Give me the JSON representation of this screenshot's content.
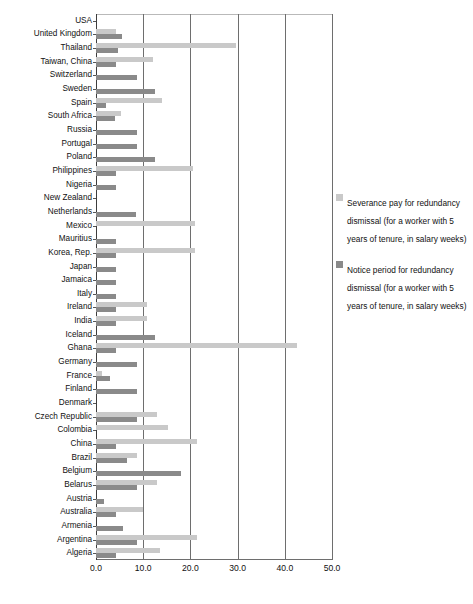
{
  "chart_data": {
    "type": "bar",
    "orientation": "horizontal",
    "title": "",
    "xlabel": "",
    "ylabel": "",
    "xlim": [
      0,
      50
    ],
    "xticks": [
      "0.0",
      "10.0",
      "20.0",
      "30.0",
      "40.0",
      "50.0"
    ],
    "grid": true,
    "legend_position": "right",
    "colors": {
      "severance": "#c9c9c9",
      "notice": "#8a8a8a",
      "gridline": "#6e6e6e",
      "background": "#ffffff"
    },
    "legend": [
      "Severance pay for redundancy dismissal (for a worker with 5 years of tenure, in salary weeks)",
      "Notice period for redundancy dismissal (for a worker with 5 years of tenure, in salary weeks)"
    ],
    "categories": [
      "USA",
      "United Kingdom",
      "Thailand",
      "Taiwan, China",
      "Switzerland",
      "Sweden",
      "Spain",
      "South Africa",
      "Russia",
      "Portugal",
      "Poland",
      "Philippines",
      "Nigeria",
      "New Zealand",
      "Netherlands",
      "Mexico",
      "Mauritius",
      "Korea, Rep.",
      "Japan",
      "Jamaica",
      "Italy",
      "Ireland",
      "India",
      "Iceland",
      "Ghana",
      "Germany",
      "France",
      "Finland",
      "Denmark",
      "Czech Republic",
      "Colombia",
      "China",
      "Brazil",
      "Belgium",
      "Belarus",
      "Austria",
      "Australia",
      "Armenia",
      "Argentina",
      "Algeria"
    ],
    "series": [
      {
        "name": "Severance pay for redundancy dismissal (for a worker with 5 years of tenure, in salary weeks)",
        "key": "severance",
        "values": [
          0.0,
          4.3,
          29.6,
          12.0,
          0.0,
          0.0,
          14.0,
          5.2,
          0.0,
          0.0,
          0.0,
          20.6,
          0.0,
          0.0,
          0.0,
          21.0,
          0.0,
          21.0,
          0.0,
          0.0,
          0.0,
          10.7,
          10.9,
          0.0,
          42.5,
          0.0,
          1.2,
          0.0,
          0.0,
          13.0,
          15.3,
          21.5,
          8.6,
          0.0,
          13.0,
          0.0,
          9.9,
          0.0,
          21.5,
          13.5
        ]
      },
      {
        "name": "Notice period for redundancy dismissal (for a worker with 5 years of tenure, in salary weeks)",
        "key": "notice",
        "values": [
          0.0,
          5.6,
          4.7,
          4.3,
          8.7,
          12.5,
          2.2,
          4.0,
          8.7,
          8.7,
          12.5,
          4.3,
          4.3,
          0.0,
          8.5,
          0.0,
          4.3,
          4.3,
          4.3,
          4.3,
          4.3,
          4.3,
          4.3,
          12.5,
          4.3,
          8.7,
          3.0,
          8.7,
          0.0,
          8.7,
          0.0,
          4.3,
          6.5,
          18.0,
          8.7,
          1.7,
          4.3,
          5.8,
          8.7,
          4.3
        ]
      }
    ]
  }
}
